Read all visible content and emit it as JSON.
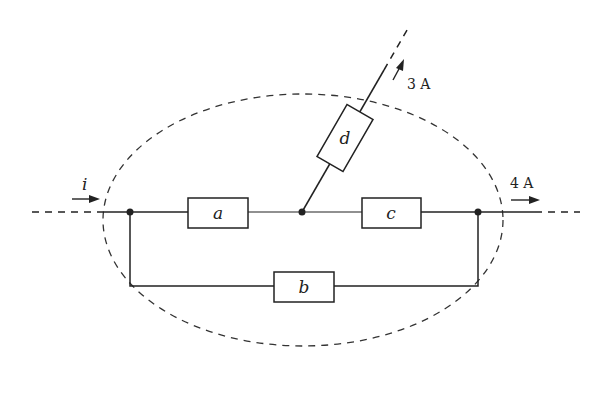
{
  "diagram": {
    "type": "circuit",
    "boundary": "dashed closed surface (ellipse) enclosing the circuit",
    "elements": [
      {
        "id": "a",
        "label": "a",
        "position": "top branch, left"
      },
      {
        "id": "b",
        "label": "b",
        "position": "bottom branch"
      },
      {
        "id": "c",
        "label": "c",
        "position": "top branch, right"
      },
      {
        "id": "d",
        "label": "d",
        "position": "diagonal branch going up-right"
      }
    ],
    "currents": {
      "input": {
        "label": "i",
        "direction": "into surface from left"
      },
      "output_right": {
        "label": "4 A",
        "direction": "out of surface to right"
      },
      "output_top": {
        "label": "3 A",
        "direction": "out of surface up-right"
      }
    },
    "nodes": 3
  }
}
